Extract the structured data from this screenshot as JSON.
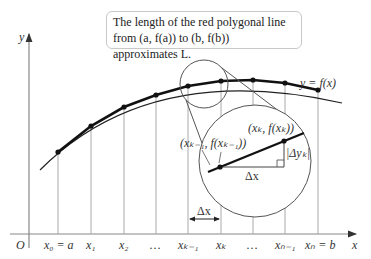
{
  "caption": {
    "line1": "The length of the red polygonal line",
    "line2": "from (a, f(a)) to (b, f(b)) approximates L."
  },
  "axes": {
    "x_label": "x",
    "y_label": "y",
    "origin_label": "O"
  },
  "curve_label": "y = f(x)",
  "tick_labels": [
    "x₀ = a",
    "x₁",
    "x₂",
    "…",
    "xₖ₋₁",
    "xₖ",
    "…",
    "xₙ₋₁",
    "xₙ = b"
  ],
  "magnifier": {
    "point_left": "(xₖ₋₁, f(xₖ₋₁))",
    "point_right": "(xₖ, f(xₖ))",
    "dx_label": "Δx",
    "dy_label": "|Δyₖ|"
  },
  "interval_label": "Δx"
}
